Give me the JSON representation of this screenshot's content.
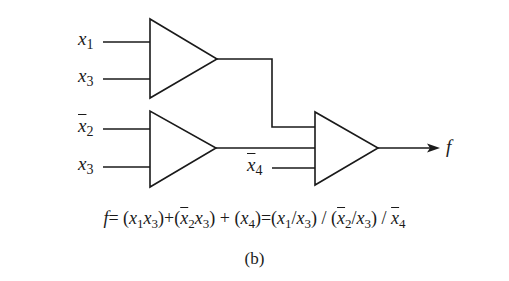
{
  "figure": {
    "caption": "(b)",
    "stroke_color": "#1a1a1a",
    "background": "#ffffff"
  },
  "inputs": {
    "gate1": [
      {
        "var": "x",
        "sub": "1",
        "negated": false
      },
      {
        "var": "x",
        "sub": "3",
        "negated": false
      }
    ],
    "gate2": [
      {
        "var": "x",
        "sub": "2",
        "negated": true
      },
      {
        "var": "x",
        "sub": "3",
        "negated": false
      }
    ],
    "gate3_extra": {
      "var": "x",
      "sub": "4",
      "negated": true
    }
  },
  "output": {
    "label": "f"
  },
  "equation": {
    "lhs": "f",
    "eq1": "=",
    "term_open": "(",
    "term_close": ")",
    "plus": "+",
    "slash": "/",
    "t1": [
      {
        "v": "x",
        "s": "1"
      },
      {
        "v": "x",
        "s": "3"
      }
    ],
    "t2": [
      {
        "v": "x",
        "s": "2"
      },
      {
        "v": "x",
        "s": "3"
      }
    ],
    "t3": [
      {
        "v": "x",
        "s": "4"
      }
    ],
    "text": "f = (x1x3) + (x̄2x3) + (x4) = (x1/x3) / (x̄2/x3) / x̄4"
  },
  "gates": [
    {
      "id": "gate-1",
      "type": "triangle",
      "inputs": 2
    },
    {
      "id": "gate-2",
      "type": "triangle",
      "inputs": 2
    },
    {
      "id": "gate-3",
      "type": "triangle",
      "inputs": 3
    }
  ]
}
